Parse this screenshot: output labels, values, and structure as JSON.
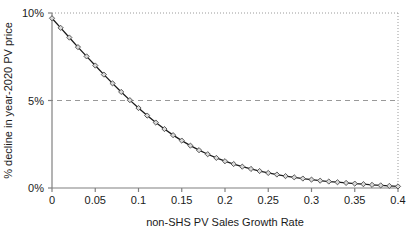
{
  "chart_data": {
    "type": "line",
    "title": "",
    "xlabel": "non-SHS PV Sales Growth Rate",
    "ylabel": "% decline in year-2020 PV price",
    "xlim": [
      0,
      0.4
    ],
    "ylim": [
      0,
      0.1
    ],
    "grid": true,
    "legend": null,
    "xticks": [
      0,
      0.05,
      0.1,
      0.15,
      0.2,
      0.25,
      0.3,
      0.35,
      0.4
    ],
    "xticklabels": [
      "0",
      "0.05",
      "0.1",
      "0.15",
      "0.2",
      "0.25",
      "0.3",
      "0.35",
      "0.4"
    ],
    "yticks": [
      0,
      0.05,
      0.1
    ],
    "yticklabels": [
      "0%",
      "5%",
      "10%"
    ],
    "marker": "diamond",
    "line_color": "#1a1a1a",
    "marker_fill": "#d9d9d9",
    "gridline_5pct": 0.05,
    "series": [
      {
        "name": "% decline in year-2020 PV price",
        "x": [
          0,
          0.01,
          0.02,
          0.03,
          0.04,
          0.05,
          0.06,
          0.07,
          0.08,
          0.09,
          0.1,
          0.11,
          0.12,
          0.13,
          0.14,
          0.15,
          0.16,
          0.17,
          0.18,
          0.19,
          0.2,
          0.21,
          0.22,
          0.23,
          0.24,
          0.25,
          0.26,
          0.27,
          0.28,
          0.29,
          0.3,
          0.31,
          0.32,
          0.33,
          0.34,
          0.35,
          0.36,
          0.37,
          0.38,
          0.39,
          0.4
        ],
        "y": [
          0.097,
          0.0915,
          0.086,
          0.0805,
          0.0752,
          0.07,
          0.0648,
          0.0598,
          0.0549,
          0.0502,
          0.0457,
          0.0414,
          0.0374,
          0.0337,
          0.0302,
          0.0271,
          0.0242,
          0.0216,
          0.0193,
          0.0172,
          0.0153,
          0.0137,
          0.0122,
          0.0109,
          0.0097,
          0.0086,
          0.0077,
          0.0068,
          0.0061,
          0.0054,
          0.0048,
          0.0042,
          0.0037,
          0.0033,
          0.0029,
          0.0025,
          0.0022,
          0.0018,
          0.0015,
          0.0012,
          0.0009
        ]
      }
    ]
  }
}
